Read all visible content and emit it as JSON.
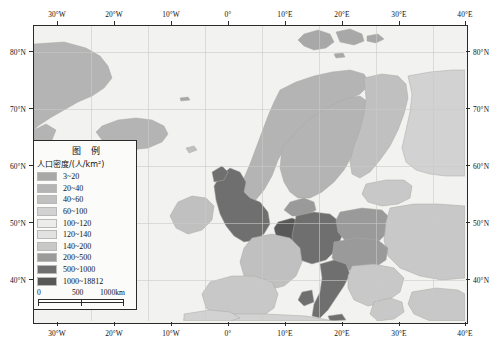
{
  "map": {
    "projection_note": "Europe population density choropleth",
    "axes": {
      "longitude_labels": [
        "30°W",
        "20°W",
        "10°W",
        "0°",
        "10°E",
        "20°E",
        "30°E",
        "40°E"
      ],
      "longitude_values": [
        -30,
        -20,
        -10,
        0,
        10,
        20,
        30,
        40
      ],
      "latitude_labels": [
        "80°N",
        "70°N",
        "60°N",
        "50°N",
        "40°N"
      ],
      "latitude_values": [
        80,
        70,
        60,
        50,
        40
      ]
    },
    "colors": {
      "ocean": "#f2f2f0",
      "frame": "#2b2b2b",
      "graticule": "#c9c9c6",
      "country_border": "#a8a8a4"
    }
  },
  "legend": {
    "title": "图 例",
    "subtitle": "人口密度/(人/km²)",
    "classes": [
      {
        "label": "3~20",
        "color": "#a8a8a8"
      },
      {
        "label": "20~40",
        "color": "#b4b4b4"
      },
      {
        "label": "40~60",
        "color": "#c0c0c0"
      },
      {
        "label": "60~100",
        "color": "#d2d2d2"
      },
      {
        "label": "100~120",
        "color": "#ececec"
      },
      {
        "label": "120~140",
        "color": "#e2e2e2"
      },
      {
        "label": "140~200",
        "color": "#c8c8c8"
      },
      {
        "label": "200~500",
        "color": "#9a9a9a"
      },
      {
        "label": "500~1000",
        "color": "#6f6f6f"
      },
      {
        "label": "1000~18812",
        "color": "#585858"
      }
    ]
  },
  "scalebar": {
    "ticks": [
      "0",
      "500",
      "1000km"
    ]
  }
}
